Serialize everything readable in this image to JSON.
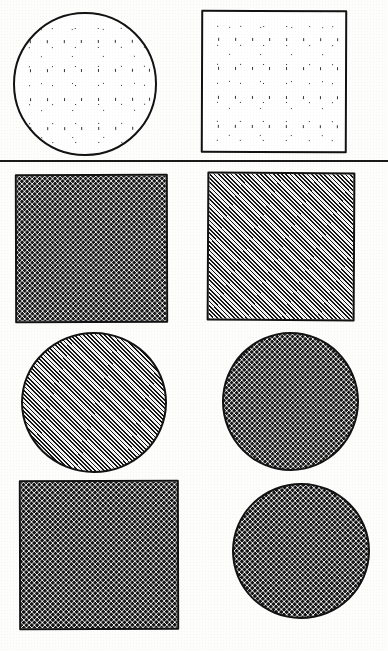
{
  "figure": {
    "caption_remnant": "",
    "background_color": "#fdfdfc",
    "ink_color": "#121212",
    "width": 388,
    "height": 651,
    "divider": {
      "name": "horizontal-rule",
      "x": 0,
      "y": 160,
      "width": 388,
      "thickness": 2
    },
    "rows": [
      {
        "index": 1,
        "shapes": [
          {
            "id": "row1-circle-stipple",
            "shape": "circle",
            "fill_pattern": "sparse-stipple",
            "fill_label": "sparse random stipple",
            "density": "low",
            "outline_color": "#121212",
            "fill_color": "#ffffff",
            "x": 13,
            "y": 12,
            "width": 144,
            "height": 144
          },
          {
            "id": "row1-square-stipple",
            "shape": "square",
            "fill_pattern": "sparse-stipple",
            "fill_label": "sparse random stipple",
            "density": "low",
            "outline_color": "#121212",
            "fill_color": "#ffffff",
            "x": 201,
            "y": 10,
            "width": 146,
            "height": 143
          }
        ]
      },
      {
        "index": 2,
        "shapes": [
          {
            "id": "row2-square-dots",
            "shape": "square",
            "fill_pattern": "checker-dots-medium",
            "fill_label": "medium checkerboard dot grid",
            "density": "medium",
            "outline_color": "#121212",
            "fill_color": "#fbfbfb",
            "x": 15,
            "y": 174,
            "width": 153,
            "height": 149
          },
          {
            "id": "row2-square-hatch",
            "shape": "square",
            "fill_pattern": "diagonal-hatch",
            "fill_label": "fine diagonal hatching",
            "density": "high",
            "outline_color": "#121212",
            "fill_color": "#e9e9e9",
            "x": 207,
            "y": 172,
            "width": 148,
            "height": 149
          }
        ]
      },
      {
        "index": 3,
        "shapes": [
          {
            "id": "row3-circle-hatch",
            "shape": "circle",
            "fill_pattern": "diagonal-hatch",
            "fill_label": "fine diagonal hatching",
            "density": "high",
            "outline_color": "#121212",
            "fill_color": "#e9e9e9",
            "x": 21,
            "y": 332,
            "width": 146,
            "height": 141
          },
          {
            "id": "row3-circle-dots",
            "shape": "circle",
            "fill_pattern": "checker-dots-medium",
            "fill_label": "medium checkerboard dot grid",
            "density": "medium",
            "outline_color": "#121212",
            "fill_color": "#fbfbfb",
            "x": 222,
            "y": 332,
            "width": 137,
            "height": 139
          }
        ]
      },
      {
        "index": 4,
        "shapes": [
          {
            "id": "row4-square-dots-dense",
            "shape": "square",
            "fill_pattern": "checker-dots-dense",
            "fill_label": "dense checkerboard dot grid",
            "density": "high",
            "outline_color": "#121212",
            "fill_color": "#fafafa",
            "x": 19,
            "y": 480,
            "width": 160,
            "height": 150
          },
          {
            "id": "row4-circle-dots-dense",
            "shape": "circle",
            "fill_pattern": "checker-dots-dense",
            "fill_label": "dense checkerboard dot grid",
            "density": "high",
            "outline_color": "#121212",
            "fill_color": "#fafafa",
            "x": 232,
            "y": 483,
            "width": 138,
            "height": 136
          }
        ]
      }
    ]
  }
}
